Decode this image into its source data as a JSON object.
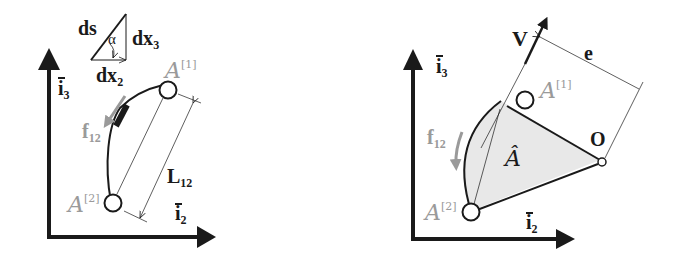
{
  "left_panel": {
    "axis_x_label": "i",
    "axis_x_sub": "2",
    "axis_y_label": "i",
    "axis_y_sub": "3",
    "triangle": {
      "hyp_label": "ds",
      "angle_label": "α",
      "vertical_label": "dx",
      "vertical_sub": "3",
      "horizontal_label": "dx",
      "horizontal_sub": "2"
    },
    "node1_label": "A",
    "node1_sup": "[1]",
    "node2_label": "A",
    "node2_sup": "[2]",
    "flux_label": "f",
    "flux_sub": "12",
    "length_label": "L",
    "length_sub": "12"
  },
  "right_panel": {
    "axis_x_label": "i",
    "axis_x_sub": "2",
    "axis_y_label": "i",
    "axis_y_sub": "3",
    "velocity_label": "V",
    "eccentricity_label": "e",
    "origin_label": "O",
    "node1_label": "A",
    "node1_sup": "[1]",
    "node2_label": "A",
    "node2_sup": "[2]",
    "flux_label": "f",
    "flux_sub": "12",
    "area_label": "Â"
  },
  "colors": {
    "ink": "#1a1a1a",
    "gray_label": "#9a9a9a",
    "fill_area": "#e8e8e8"
  }
}
